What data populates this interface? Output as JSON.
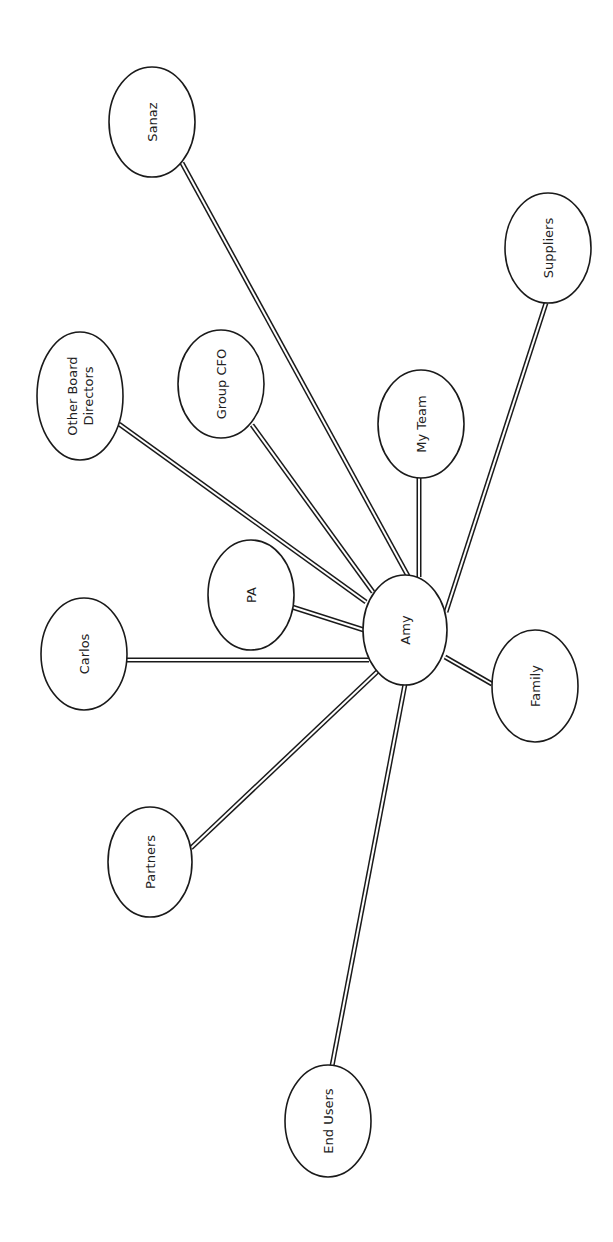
{
  "diagram": {
    "type": "stakeholder-map",
    "orientation": "rotated-90-ccw",
    "center": "amy",
    "colors": {
      "stroke": "#1a1a1a",
      "fill": "#ffffff",
      "text": "#222222",
      "background": "#ffffff"
    },
    "nodes": [
      {
        "id": "amy",
        "label": [
          "Amy"
        ],
        "cx": 405,
        "cy": 630,
        "rx": 42,
        "ry": 55
      },
      {
        "id": "sanaz",
        "label": [
          "Sanaz"
        ],
        "cx": 152,
        "cy": 122,
        "rx": 43,
        "ry": 55
      },
      {
        "id": "suppliers",
        "label": [
          "Suppliers"
        ],
        "cx": 548,
        "cy": 248,
        "rx": 43,
        "ry": 55
      },
      {
        "id": "other-board-directors",
        "label": [
          "Other Board",
          "Directors"
        ],
        "cx": 80,
        "cy": 396,
        "rx": 43,
        "ry": 64
      },
      {
        "id": "group-cfo",
        "label": [
          "Group CFO"
        ],
        "cx": 221,
        "cy": 384,
        "rx": 43,
        "ry": 54
      },
      {
        "id": "my-team",
        "label": [
          "My Team"
        ],
        "cx": 421,
        "cy": 424,
        "rx": 43,
        "ry": 54
      },
      {
        "id": "pa",
        "label": [
          "PA"
        ],
        "cx": 251,
        "cy": 595,
        "rx": 43,
        "ry": 55
      },
      {
        "id": "carlos",
        "label": [
          "Carlos"
        ],
        "cx": 84,
        "cy": 654,
        "rx": 43,
        "ry": 56
      },
      {
        "id": "family",
        "label": [
          "Family"
        ],
        "cx": 535,
        "cy": 686,
        "rx": 43,
        "ry": 56
      },
      {
        "id": "partners",
        "label": [
          "Partners"
        ],
        "cx": 150,
        "cy": 862,
        "rx": 42,
        "ry": 55
      },
      {
        "id": "end-users",
        "label": [
          "End Users"
        ],
        "cx": 328,
        "cy": 1121,
        "rx": 43,
        "ry": 56
      }
    ],
    "edges": [
      {
        "from": "amy",
        "to": "sanaz",
        "x1": 408,
        "y1": 576,
        "x2": 182,
        "y2": 163
      },
      {
        "from": "amy",
        "to": "suppliers",
        "x1": 446,
        "y1": 612,
        "x2": 546,
        "y2": 303
      },
      {
        "from": "amy",
        "to": "other-board-directors",
        "x1": 366,
        "y1": 602,
        "x2": 119,
        "y2": 424
      },
      {
        "from": "amy",
        "to": "group-cfo",
        "x1": 373,
        "y1": 592,
        "x2": 252,
        "y2": 425
      },
      {
        "from": "amy",
        "to": "my-team",
        "x1": 419,
        "y1": 577,
        "x2": 419,
        "y2": 478
      },
      {
        "from": "amy",
        "to": "pa",
        "x1": 364,
        "y1": 630,
        "x2": 292,
        "y2": 607
      },
      {
        "from": "amy",
        "to": "carlos",
        "x1": 369,
        "y1": 660,
        "x2": 127,
        "y2": 660
      },
      {
        "from": "amy",
        "to": "family",
        "x1": 445,
        "y1": 657,
        "x2": 492,
        "y2": 684
      },
      {
        "from": "amy",
        "to": "partners",
        "x1": 378,
        "y1": 671,
        "x2": 191,
        "y2": 848
      },
      {
        "from": "amy",
        "to": "end-users",
        "x1": 405,
        "y1": 684,
        "x2": 332,
        "y2": 1066
      }
    ]
  }
}
